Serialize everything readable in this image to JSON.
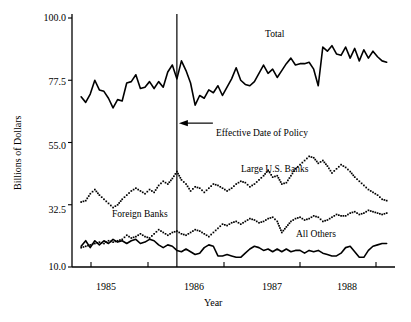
{
  "chart_data": {
    "type": "line",
    "title": "",
    "xlabel": "Year",
    "ylabel": "Billions of Dollars",
    "ylim": [
      10.0,
      100.0
    ],
    "yticks": [
      "100.0",
      "77.5",
      "55.0",
      "32.5",
      "10.0"
    ],
    "ytick_values": [
      100.0,
      77.5,
      55.0,
      32.5,
      10.0
    ],
    "xticks": [
      "1985",
      "1986",
      "1987",
      "1988"
    ],
    "xtick_values": [
      1985,
      1986,
      1987,
      1988
    ],
    "xlim": [
      1984.5,
      1988.75
    ],
    "grid": false,
    "legend_position": "inline-annotations",
    "annotations": [
      {
        "name": "total-label",
        "text": "Total",
        "x": 1986.45,
        "y": 92.0
      },
      {
        "name": "large-us-banks-label",
        "text": "Large U.S. Banks",
        "x": 1986.65,
        "y": 48.0
      },
      {
        "name": "foreign-banks-label",
        "text": "Foreign Banks",
        "x": 1985.35,
        "y": 31.0
      },
      {
        "name": "all-others-label",
        "text": "All Others",
        "x": 1987.35,
        "y": 20.0
      },
      {
        "name": "policy-line-label",
        "text": "Effective Date of Policy",
        "x": 1986.0,
        "y": 64.0
      }
    ],
    "vertical_line": {
      "name": "effective-date-of-policy",
      "x": 1985.88,
      "label": "Effective Date of Policy"
    },
    "series": [
      {
        "name": "Total",
        "style": "solid",
        "color": "#000000",
        "x": [
          1984.62,
          1984.68,
          1984.74,
          1984.8,
          1984.86,
          1984.92,
          1984.98,
          1985.04,
          1985.1,
          1985.16,
          1985.22,
          1985.28,
          1985.34,
          1985.4,
          1985.46,
          1985.52,
          1985.58,
          1985.64,
          1985.7,
          1985.76,
          1985.82,
          1985.88,
          1985.94,
          1986.0,
          1986.06,
          1986.12,
          1986.18,
          1986.24,
          1986.3,
          1986.36,
          1986.42,
          1986.48,
          1986.54,
          1986.6,
          1986.66,
          1986.72,
          1986.78,
          1986.84,
          1986.9,
          1986.96,
          1987.02,
          1987.08,
          1987.14,
          1987.2,
          1987.26,
          1987.32,
          1987.38,
          1987.44,
          1987.5,
          1987.56,
          1987.62,
          1987.68,
          1987.74,
          1987.8,
          1987.86,
          1987.92,
          1987.98,
          1988.04,
          1988.1,
          1988.16,
          1988.22,
          1988.28,
          1988.34,
          1988.4,
          1988.46,
          1988.52,
          1988.58,
          1988.64
        ],
        "values": [
          71.5,
          69.5,
          72.5,
          77.5,
          74.0,
          73.5,
          71.0,
          67.5,
          70.5,
          70.0,
          76.5,
          77.0,
          79.5,
          74.5,
          75.0,
          77.0,
          74.5,
          77.0,
          75.0,
          80.5,
          83.0,
          78.0,
          84.5,
          81.0,
          76.5,
          68.5,
          72.0,
          71.0,
          74.0,
          73.0,
          75.5,
          72.0,
          75.0,
          78.0,
          82.0,
          77.5,
          76.0,
          75.5,
          77.0,
          80.0,
          83.0,
          80.0,
          81.5,
          78.5,
          81.0,
          83.5,
          85.5,
          83.0,
          83.5,
          83.5,
          84.0,
          81.5,
          75.5,
          89.5,
          88.0,
          90.0,
          87.0,
          86.5,
          89.5,
          85.5,
          89.0,
          84.5,
          88.5,
          85.5,
          88.0,
          86.0,
          84.5,
          84.0
        ]
      },
      {
        "name": "Large U.S. Banks",
        "style": "dotted",
        "color": "#000000",
        "x": [
          1984.62,
          1984.68,
          1984.74,
          1984.8,
          1984.86,
          1984.92,
          1984.98,
          1985.04,
          1985.1,
          1985.16,
          1985.22,
          1985.28,
          1985.34,
          1985.4,
          1985.46,
          1985.52,
          1985.58,
          1985.64,
          1985.7,
          1985.76,
          1985.82,
          1985.88,
          1985.94,
          1986.0,
          1986.06,
          1986.12,
          1986.18,
          1986.24,
          1986.3,
          1986.36,
          1986.42,
          1986.48,
          1986.54,
          1986.6,
          1986.66,
          1986.72,
          1986.78,
          1986.84,
          1986.9,
          1986.96,
          1987.02,
          1987.08,
          1987.14,
          1987.2,
          1987.26,
          1987.32,
          1987.38,
          1987.44,
          1987.5,
          1987.56,
          1987.62,
          1987.68,
          1987.74,
          1987.8,
          1987.86,
          1987.92,
          1987.98,
          1988.04,
          1988.1,
          1988.16,
          1988.22,
          1988.28,
          1988.34,
          1988.4,
          1988.46,
          1988.52,
          1988.58,
          1988.64
        ],
        "values": [
          33.5,
          34.0,
          36.5,
          38.0,
          36.0,
          34.5,
          33.0,
          31.5,
          32.5,
          34.5,
          36.0,
          37.5,
          38.5,
          37.5,
          36.5,
          38.0,
          37.0,
          39.5,
          41.0,
          40.0,
          42.0,
          44.5,
          41.5,
          40.0,
          37.5,
          39.0,
          38.5,
          37.0,
          38.5,
          40.0,
          39.5,
          38.5,
          37.5,
          38.5,
          40.0,
          41.0,
          40.5,
          39.0,
          40.0,
          41.5,
          43.0,
          45.0,
          42.5,
          43.0,
          40.0,
          40.5,
          43.0,
          45.5,
          47.0,
          48.5,
          50.0,
          49.5,
          47.5,
          48.5,
          46.5,
          44.0,
          45.5,
          47.0,
          46.0,
          44.5,
          42.5,
          41.0,
          39.5,
          38.0,
          37.0,
          36.0,
          34.5,
          34.0
        ]
      },
      {
        "name": "Foreign Banks",
        "style": "dotted",
        "color": "#000000",
        "x": [
          1984.62,
          1984.68,
          1984.74,
          1984.8,
          1984.86,
          1984.92,
          1984.98,
          1985.04,
          1985.1,
          1985.16,
          1985.22,
          1985.28,
          1985.34,
          1985.4,
          1985.46,
          1985.52,
          1985.58,
          1985.64,
          1985.7,
          1985.76,
          1985.82,
          1985.88,
          1985.94,
          1986.0,
          1986.06,
          1986.12,
          1986.18,
          1986.24,
          1986.3,
          1986.36,
          1986.42,
          1986.48,
          1986.54,
          1986.6,
          1986.66,
          1986.72,
          1986.78,
          1986.84,
          1986.9,
          1986.96,
          1987.02,
          1987.08,
          1987.14,
          1987.2,
          1987.26,
          1987.32,
          1987.38,
          1987.44,
          1987.5,
          1987.56,
          1987.62,
          1987.68,
          1987.74,
          1987.8,
          1987.86,
          1987.92,
          1987.98,
          1988.04,
          1988.1,
          1988.16,
          1988.22,
          1988.28,
          1988.34,
          1988.4,
          1988.46,
          1988.52,
          1988.58,
          1988.64
        ],
        "values": [
          17.0,
          17.5,
          18.0,
          18.5,
          19.0,
          18.5,
          19.5,
          19.0,
          19.5,
          20.0,
          21.5,
          20.5,
          21.0,
          22.0,
          21.0,
          20.5,
          22.0,
          23.5,
          22.5,
          21.5,
          22.5,
          23.0,
          22.0,
          21.5,
          22.5,
          23.5,
          23.0,
          22.0,
          21.0,
          22.5,
          24.0,
          25.5,
          25.0,
          26.0,
          26.5,
          25.5,
          26.5,
          27.5,
          27.0,
          26.0,
          26.5,
          27.5,
          28.0,
          26.5,
          22.5,
          24.5,
          26.5,
          27.5,
          28.0,
          27.0,
          27.5,
          28.5,
          28.0,
          26.5,
          27.0,
          28.0,
          29.0,
          28.5,
          28.5,
          29.5,
          30.0,
          29.0,
          29.5,
          30.5,
          30.0,
          29.5,
          29.0,
          29.5
        ]
      },
      {
        "name": "All Others",
        "style": "solid",
        "color": "#000000",
        "x": [
          1984.62,
          1984.68,
          1984.74,
          1984.8,
          1984.86,
          1984.92,
          1984.98,
          1985.04,
          1985.1,
          1985.16,
          1985.22,
          1985.28,
          1985.34,
          1985.4,
          1985.46,
          1985.52,
          1985.58,
          1985.64,
          1985.7,
          1985.76,
          1985.82,
          1985.88,
          1985.94,
          1986.0,
          1986.06,
          1986.12,
          1986.18,
          1986.24,
          1986.3,
          1986.36,
          1986.42,
          1986.48,
          1986.54,
          1986.6,
          1986.66,
          1986.72,
          1986.78,
          1986.84,
          1986.9,
          1986.96,
          1987.02,
          1987.08,
          1987.14,
          1987.2,
          1987.26,
          1987.32,
          1987.38,
          1987.44,
          1987.5,
          1987.56,
          1987.62,
          1987.68,
          1987.74,
          1987.8,
          1987.86,
          1987.92,
          1987.98,
          1988.04,
          1988.1,
          1988.16,
          1988.22,
          1988.28,
          1988.34,
          1988.4,
          1988.46,
          1988.52,
          1988.58,
          1988.64
        ],
        "values": [
          17.5,
          19.5,
          17.0,
          19.5,
          18.0,
          19.5,
          18.5,
          20.0,
          19.0,
          19.5,
          18.5,
          19.5,
          20.0,
          18.5,
          19.0,
          20.0,
          19.5,
          18.0,
          17.0,
          18.0,
          17.5,
          16.0,
          15.5,
          16.5,
          15.5,
          14.5,
          15.0,
          17.0,
          18.0,
          17.5,
          14.0,
          14.0,
          14.5,
          14.0,
          13.5,
          13.5,
          15.0,
          16.5,
          17.5,
          17.0,
          16.0,
          16.5,
          15.5,
          16.5,
          15.5,
          16.5,
          15.5,
          16.0,
          16.0,
          15.0,
          16.0,
          15.5,
          16.0,
          15.0,
          14.5,
          14.0,
          14.0,
          15.0,
          17.0,
          17.5,
          15.5,
          13.5,
          13.5,
          16.0,
          17.5,
          18.0,
          18.5,
          18.5
        ]
      }
    ]
  }
}
